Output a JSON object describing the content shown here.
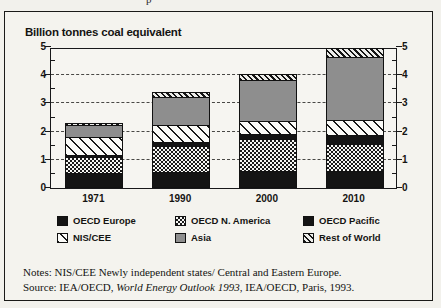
{
  "figure": {
    "cutoff_fragment": "p",
    "y_axis_title": "Billion tonnes coal equivalent"
  },
  "chart_data": {
    "type": "bar",
    "stacked": true,
    "title": "Billion tonnes coal equivalent",
    "xlabel": "",
    "ylabel": "Billion tonnes coal equivalent",
    "ylim": [
      0,
      5
    ],
    "yticks": [
      0,
      1,
      2,
      3,
      4,
      5
    ],
    "ytick_labels": [
      "0",
      "1",
      "2",
      "3",
      "4",
      "5"
    ],
    "minor_ticks_per_interval": 2,
    "grid": true,
    "grid_style": "dashed",
    "grid_at": [
      1,
      2,
      3,
      4
    ],
    "dual_axis": true,
    "categories": [
      "1971",
      "1990",
      "2000",
      "2010"
    ],
    "legend_position": "below-plot",
    "series": [
      {
        "name": "OECD Europe",
        "pattern": "solid-black",
        "values": [
          0.55,
          0.58,
          0.6,
          0.62
        ]
      },
      {
        "name": "OECD N. America",
        "pattern": "checkerboard",
        "values": [
          0.55,
          0.92,
          1.15,
          0.93
        ]
      },
      {
        "name": "OECD Pacific",
        "pattern": "solid-black",
        "values": [
          0.06,
          0.12,
          0.17,
          0.33
        ]
      },
      {
        "name": "NIS/CEE",
        "pattern": "diagonal-wide",
        "values": [
          0.66,
          0.62,
          0.45,
          0.55
        ]
      },
      {
        "name": "Asia",
        "pattern": "solid-gray",
        "values": [
          0.4,
          0.98,
          1.45,
          2.23
        ]
      },
      {
        "name": "Rest of World",
        "pattern": "diagonal-narrow",
        "values": [
          0.08,
          0.2,
          0.21,
          0.29
        ]
      }
    ],
    "totals": [
      2.3,
      3.42,
      4.03,
      4.95
    ]
  },
  "legend": {
    "items": [
      {
        "label": "OECD Europe",
        "pattern": "solid-black"
      },
      {
        "label": "OECD N. America",
        "pattern": "checkerboard"
      },
      {
        "label": "OECD Pacific",
        "pattern": "solid-black"
      },
      {
        "label": "NIS/CEE",
        "pattern": "diagonal-wide"
      },
      {
        "label": "Asia",
        "pattern": "solid-gray"
      },
      {
        "label": "Rest of World",
        "pattern": "diagonal-narrow"
      }
    ]
  },
  "notes": {
    "line1": "Notes: NIS/CEE Newly independent states/ Central and Eastern Europe.",
    "source_prefix": "Source: IEA/OECD, ",
    "source_italic": "World Energy Outlook 1993",
    "source_suffix": ", IEA/OECD, Paris, 1993."
  }
}
